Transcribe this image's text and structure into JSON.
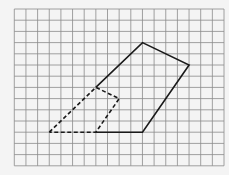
{
  "diagram": {
    "type": "grid-figure",
    "grid": {
      "columns": 18,
      "rows": 14,
      "origin_px": [
        14.3,
        9
      ],
      "cell_w": 11.65,
      "cell_h": 11.2,
      "line_color": "#8a8a8a",
      "background": "#f4f4f4"
    },
    "solid_shape": {
      "style": "solid",
      "color": "#1a1a1a",
      "vertices": [
        [
          7,
          7
        ],
        [
          11,
          3
        ],
        [
          15,
          5
        ],
        [
          11,
          11
        ],
        [
          7,
          11
        ]
      ]
    },
    "dashed_shape": {
      "style": "dashed",
      "color": "#1a1a1a",
      "vertices": [
        [
          3,
          11
        ],
        [
          7,
          7
        ],
        [
          9,
          8
        ],
        [
          7,
          11
        ],
        [
          3,
          11
        ]
      ]
    }
  }
}
